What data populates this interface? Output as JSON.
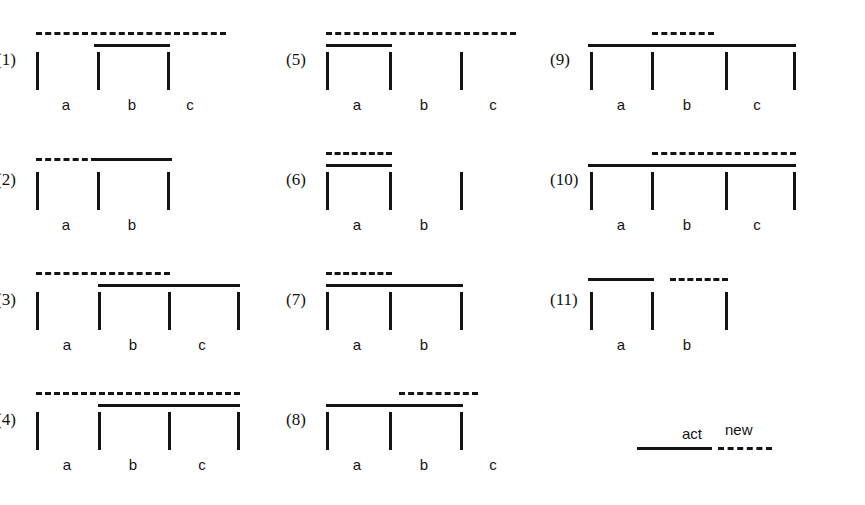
{
  "figure": {
    "title": "",
    "legend": {
      "items": [
        {
          "label": "act",
          "style": "solid"
        },
        {
          "label": "new",
          "style": "dashed"
        }
      ]
    },
    "line_color": "#141414",
    "panels": [
      {
        "id": "1",
        "label": "(1)",
        "origin": {
          "x": 36,
          "y": 20
        },
        "ticks": [
          {
            "x": 36
          },
          {
            "x": 97
          },
          {
            "x": 167
          }
        ],
        "tick_labels": [
          "a",
          "b",
          "c"
        ],
        "tick_label_positions": [
          66,
          132,
          190
        ],
        "segments": [
          {
            "style": "dashed",
            "x1": 36,
            "x2": 226,
            "y": 12
          },
          {
            "style": "solid",
            "x1": 94,
            "x2": 170,
            "y": 24
          }
        ]
      },
      {
        "id": "2",
        "label": "(2)",
        "origin": {
          "x": 36,
          "y": 140
        },
        "ticks": [
          {
            "x": 36
          },
          {
            "x": 97
          },
          {
            "x": 167
          }
        ],
        "tick_labels": [
          "a",
          "b"
        ],
        "tick_label_positions": [
          66,
          132
        ],
        "segments": [
          {
            "style": "dashed",
            "x1": 36,
            "x2": 97,
            "y": 18
          },
          {
            "style": "solid",
            "x1": 97,
            "x2": 172,
            "y": 18
          }
        ]
      },
      {
        "id": "3",
        "label": "(3)",
        "origin": {
          "x": 36,
          "y": 260
        },
        "ticks": [
          {
            "x": 36
          },
          {
            "x": 98
          },
          {
            "x": 168
          },
          {
            "x": 237
          }
        ],
        "tick_labels": [
          "a",
          "b",
          "c"
        ],
        "tick_label_positions": [
          67,
          133,
          202
        ],
        "segments": [
          {
            "style": "dashed",
            "x1": 36,
            "x2": 170,
            "y": 12
          },
          {
            "style": "solid",
            "x1": 98,
            "x2": 240,
            "y": 24
          }
        ]
      },
      {
        "id": "4",
        "label": "(4)",
        "origin": {
          "x": 36,
          "y": 380
        },
        "ticks": [
          {
            "x": 36
          },
          {
            "x": 98
          },
          {
            "x": 168
          },
          {
            "x": 237
          }
        ],
        "tick_labels": [
          "a",
          "b",
          "c"
        ],
        "tick_label_positions": [
          67,
          133,
          202
        ],
        "segments": [
          {
            "style": "dashed",
            "x1": 36,
            "x2": 240,
            "y": 12
          },
          {
            "style": "solid",
            "x1": 98,
            "x2": 240,
            "y": 24
          }
        ]
      },
      {
        "id": "5",
        "label": "(5)",
        "origin": {
          "x": 326,
          "y": 20
        },
        "ticks": [
          {
            "x": 326
          },
          {
            "x": 389
          },
          {
            "x": 460
          }
        ],
        "tick_labels": [
          "a",
          "b",
          "c"
        ],
        "tick_label_positions": [
          357,
          424,
          493
        ],
        "segments": [
          {
            "style": "dashed",
            "x1": 326,
            "x2": 516,
            "y": 12
          },
          {
            "style": "solid",
            "x1": 326,
            "x2": 392,
            "y": 24
          }
        ]
      },
      {
        "id": "6",
        "label": "(6)",
        "origin": {
          "x": 326,
          "y": 140
        },
        "ticks": [
          {
            "x": 326
          },
          {
            "x": 389
          },
          {
            "x": 460
          }
        ],
        "tick_labels": [
          "a",
          "b"
        ],
        "tick_label_positions": [
          357,
          424
        ],
        "segments": [
          {
            "style": "dashed",
            "x1": 326,
            "x2": 392,
            "y": 12
          },
          {
            "style": "solid",
            "x1": 326,
            "x2": 392,
            "y": 24
          }
        ]
      },
      {
        "id": "7",
        "label": "(7)",
        "origin": {
          "x": 326,
          "y": 260
        },
        "ticks": [
          {
            "x": 326
          },
          {
            "x": 389
          },
          {
            "x": 460
          }
        ],
        "tick_labels": [
          "a",
          "b"
        ],
        "tick_label_positions": [
          357,
          424
        ],
        "segments": [
          {
            "style": "dashed",
            "x1": 326,
            "x2": 392,
            "y": 12
          },
          {
            "style": "solid",
            "x1": 326,
            "x2": 463,
            "y": 24
          }
        ]
      },
      {
        "id": "8",
        "label": "(8)",
        "origin": {
          "x": 326,
          "y": 380
        },
        "ticks": [
          {
            "x": 326
          },
          {
            "x": 389
          },
          {
            "x": 460
          }
        ],
        "tick_labels": [
          "a",
          "b",
          "c"
        ],
        "tick_label_positions": [
          357,
          424,
          493
        ],
        "segments": [
          {
            "style": "dashed",
            "x1": 399,
            "x2": 478,
            "y": 12
          },
          {
            "style": "solid",
            "x1": 326,
            "x2": 463,
            "y": 24
          }
        ]
      },
      {
        "id": "9",
        "label": "(9)",
        "origin": {
          "x": 590,
          "y": 20
        },
        "ticks": [
          {
            "x": 590
          },
          {
            "x": 651
          },
          {
            "x": 725
          },
          {
            "x": 793
          }
        ],
        "tick_labels": [
          "a",
          "b",
          "c"
        ],
        "tick_label_positions": [
          621,
          687,
          757
        ],
        "segments": [
          {
            "style": "dashed",
            "x1": 652,
            "x2": 714,
            "y": 12
          },
          {
            "style": "solid",
            "x1": 588,
            "x2": 796,
            "y": 24
          }
        ]
      },
      {
        "id": "10",
        "label": "(10)",
        "origin": {
          "x": 590,
          "y": 140
        },
        "ticks": [
          {
            "x": 590
          },
          {
            "x": 651
          },
          {
            "x": 725
          },
          {
            "x": 793
          }
        ],
        "tick_labels": [
          "a",
          "b",
          "c"
        ],
        "tick_label_positions": [
          621,
          687,
          757
        ],
        "segments": [
          {
            "style": "dashed",
            "x1": 652,
            "x2": 796,
            "y": 12
          },
          {
            "style": "solid",
            "x1": 588,
            "x2": 796,
            "y": 24
          }
        ]
      },
      {
        "id": "11",
        "label": "(11)",
        "origin": {
          "x": 590,
          "y": 260
        },
        "ticks": [
          {
            "x": 590
          },
          {
            "x": 651
          },
          {
            "x": 725
          }
        ],
        "tick_labels": [
          "a",
          "b"
        ],
        "tick_label_positions": [
          621,
          687
        ],
        "segments": [
          {
            "style": "solid",
            "x1": 588,
            "x2": 654,
            "y": 18
          },
          {
            "style": "dashed",
            "x1": 670,
            "x2": 728,
            "y": 18
          }
        ]
      }
    ],
    "legend_geometry": {
      "act_label_x": 682,
      "act_label_y": 425,
      "act_line_x1": 637,
      "act_line_x2": 712,
      "act_line_y": 447,
      "new_label_x": 725,
      "new_label_y": 421,
      "new_line_x1": 718,
      "new_line_x2": 772,
      "new_line_y": 447
    }
  }
}
